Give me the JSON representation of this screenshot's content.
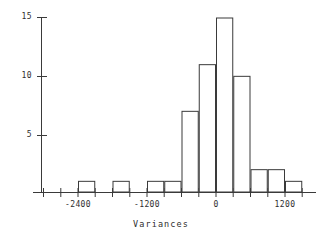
{
  "chart_data": {
    "type": "bar",
    "title": "",
    "subtitle": "",
    "xlabel": "Variances",
    "ylabel": "",
    "grid": false,
    "legend": null,
    "bin_width": 300,
    "xlim": [
      -2700,
      1800
    ],
    "ylim": [
      0,
      15
    ],
    "xticks": [
      -2400,
      -1200,
      0,
      1200
    ],
    "xtick_labels": [
      "-2400",
      "-1200",
      "0",
      "1200"
    ],
    "yticks": [
      5,
      10,
      15
    ],
    "ytick_labels": [
      "5",
      "10",
      "15"
    ],
    "categories": [
      "-2400 to -2100",
      "-1800 to -1500",
      "-1200 to -900",
      "-900 to -600",
      "-600 to -300",
      "-300 to 0",
      "0 to 300",
      "300 to 600",
      "600 to 900",
      "900 to 1200",
      "1200 to 1500"
    ],
    "bins": [
      {
        "x0": -2400,
        "x1": -2100,
        "value": 1
      },
      {
        "x0": -1800,
        "x1": -1500,
        "value": 1
      },
      {
        "x0": -1200,
        "x1": -900,
        "value": 1
      },
      {
        "x0": -900,
        "x1": -600,
        "value": 1
      },
      {
        "x0": -600,
        "x1": -300,
        "value": 7
      },
      {
        "x0": -300,
        "x1": 0,
        "value": 11
      },
      {
        "x0": 0,
        "x1": 300,
        "value": 15
      },
      {
        "x0": 300,
        "x1": 600,
        "value": 10
      },
      {
        "x0": 600,
        "x1": 900,
        "value": 2
      },
      {
        "x0": 900,
        "x1": 1200,
        "value": 2
      },
      {
        "x0": 1200,
        "x1": 1500,
        "value": 1
      }
    ],
    "values": [
      1,
      1,
      1,
      1,
      7,
      11,
      15,
      10,
      2,
      2,
      1
    ],
    "colors": {
      "bar_stroke": "#3a3a3a",
      "bar_fill": "#ffffff",
      "axis": "#3a3a3a",
      "text": "#2e2e2e",
      "background": "#ffffff"
    }
  },
  "axis": {
    "x_title": "Variances"
  }
}
